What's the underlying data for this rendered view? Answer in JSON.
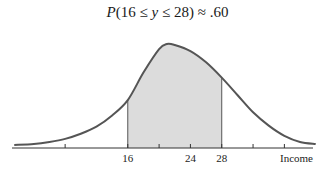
{
  "chart_data": {
    "type": "area",
    "title": "P(16 ≤ y ≤ 28) ≈ .60",
    "title_parts": {
      "p": "P",
      "open": "(16 ≤ ",
      "var": "y",
      "close": " ≤ 28) ≈ .60"
    },
    "xlabel": "Income",
    "ylabel": "",
    "xlim": [
      1.5,
      40
    ],
    "ticks": [
      8,
      16,
      20,
      24,
      28,
      32,
      36
    ],
    "tick_labels": [
      {
        "value": 16,
        "label": "16"
      },
      {
        "value": 24,
        "label": "24"
      },
      {
        "value": 28,
        "label": "28"
      }
    ],
    "shaded_interval": [
      16,
      28
    ],
    "shaded_probability": 0.6,
    "curve": {
      "description": "right-skewed income density",
      "x": [
        1.5,
        4,
        6,
        8,
        10,
        12,
        14,
        16,
        18,
        20,
        21,
        22,
        24,
        26,
        28,
        30,
        32,
        34,
        36,
        38,
        40
      ],
      "y": [
        0.01,
        0.02,
        0.04,
        0.07,
        0.12,
        0.19,
        0.3,
        0.45,
        0.72,
        0.95,
        1.0,
        0.99,
        0.93,
        0.82,
        0.67,
        0.5,
        0.33,
        0.2,
        0.1,
        0.04,
        0.02
      ]
    },
    "colors": {
      "curve": "#555555",
      "fill": "#dcdcdc",
      "axis": "#333333"
    }
  }
}
